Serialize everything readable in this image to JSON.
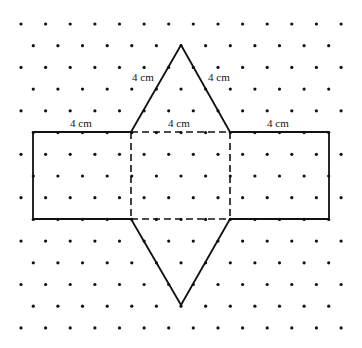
{
  "diagram": {
    "type": "net-of-triangular-prism",
    "grid": {
      "kind": "isometric-dot-grid",
      "rows": 15,
      "row_spacing": 21.71,
      "col_spacing": 24.62,
      "first_row_y": 24,
      "even_row_start_x": 21,
      "even_row_count": 14,
      "odd_row_start_x": 33.3,
      "odd_row_count": 13,
      "dot_color": "#111111"
    },
    "labels": {
      "left_rect_top": "4 cm",
      "middle_rect_top": "4 cm",
      "right_rect_top": "4 cm",
      "top_triangle_left": "4 cm",
      "top_triangle_right": "4 cm"
    },
    "shapes": {
      "top_apex": [
        181,
        45
      ],
      "bottom_apex": [
        181,
        305
      ],
      "rect_top_y": 132,
      "rect_bottom_y": 219,
      "left_rect_x": [
        33,
        131
      ],
      "middle_rect_x": [
        131,
        230
      ],
      "right_rect_x": [
        230,
        329
      ]
    }
  }
}
